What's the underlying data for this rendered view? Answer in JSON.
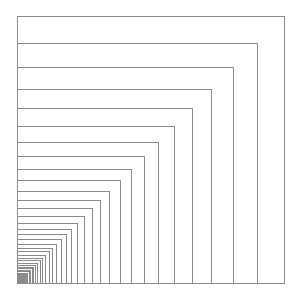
{
  "diagram": {
    "type": "nested-squares",
    "anchor_corner": "bottom-left",
    "anchor_x": 17,
    "anchor_y": 284,
    "largest_side": 268,
    "scale_ratio": 0.9,
    "count": 48,
    "line_color": "#8a8a8a",
    "background": "#ffffff"
  }
}
